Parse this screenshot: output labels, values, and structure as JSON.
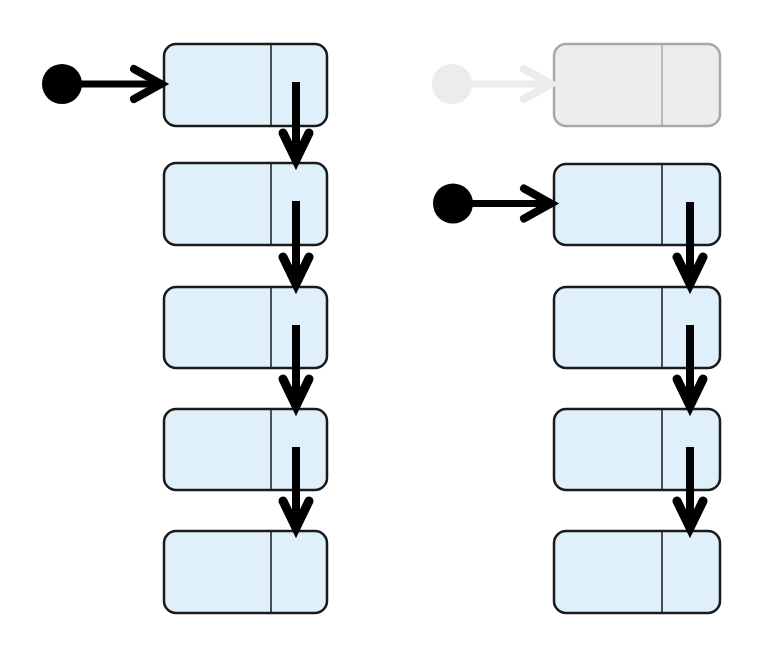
{
  "diagram": {
    "colors": {
      "node_fill": "#dff0fa",
      "node_stroke": "#1a1a1a",
      "pointer": "#000000",
      "faded_fill": "#ededed",
      "faded_stroke": "#a8a8a8",
      "faded_pointer": "#ececec",
      "background": "#ffffff"
    },
    "lists": [
      {
        "id": "before",
        "label": "original list",
        "head": {
          "cx": 62,
          "cy": 84,
          "r": 20,
          "faded": false
        },
        "node_x": 164,
        "node_w": 163,
        "divider_x": 271,
        "pointer_x": 296,
        "nodes": [
          {
            "y": 44,
            "h": 82,
            "faded": false
          },
          {
            "y": 163,
            "h": 82,
            "faded": false
          },
          {
            "y": 287,
            "h": 81,
            "faded": false
          },
          {
            "y": 409,
            "h": 81,
            "faded": false
          },
          {
            "y": 531,
            "h": 82,
            "faded": false
          }
        ]
      },
      {
        "id": "after",
        "label": "list after head removal",
        "old_head": {
          "cx": 452,
          "cy": 84,
          "r": 20,
          "faded": true
        },
        "head": {
          "cx": 453,
          "cy": 206,
          "r": 20,
          "faded": false
        },
        "node_x": 554,
        "node_w": 166,
        "divider_x": 662,
        "pointer_x": 690,
        "nodes": [
          {
            "y": 44,
            "h": 82,
            "faded": true
          },
          {
            "y": 164,
            "h": 81,
            "faded": false
          },
          {
            "y": 287,
            "h": 81,
            "faded": false
          },
          {
            "y": 409,
            "h": 81,
            "faded": false
          },
          {
            "y": 531,
            "h": 82,
            "faded": false
          }
        ]
      }
    ]
  }
}
